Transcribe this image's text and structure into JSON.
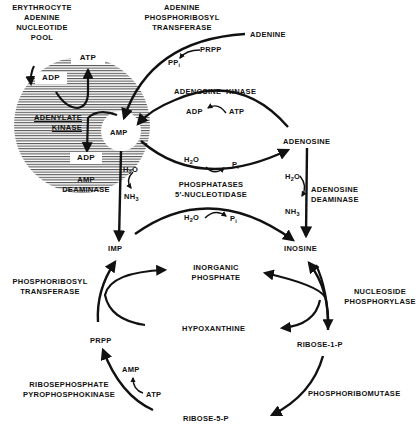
{
  "pool": {
    "label_lines": [
      "ERYTHROCYTE",
      "ADENINE",
      "NUCLEOTIDE",
      "POOL"
    ],
    "atp_box": "ATP",
    "adp_box_top": "ADP",
    "adp_box_bottom": "ADP",
    "enzyme_lines": [
      "ADENYLATE",
      "KINASE"
    ],
    "amp": "AMP"
  },
  "enzymes": {
    "adenine_prt": [
      "ADENINE",
      "PHOSPHORIBOSYL",
      "TRANSFERASE"
    ],
    "adenosine_kinase": "ADENOSINE  KINASE",
    "amp_deaminase": [
      "AMP",
      "DEAMINASE"
    ],
    "phosphatases": [
      "PHOSPHATASES",
      "5′-NUCLEOTIDASE"
    ],
    "adenosine_deaminase": [
      "ADENOSINE",
      "DEAMINASE"
    ],
    "phosphoribosyl_transferase": [
      "PHOSPHORIBOSYL",
      "TRANSFERASE"
    ],
    "nucleoside_phosphorylase": [
      "NUCLEOSIDE",
      "PHOSPHORYLASE"
    ],
    "ribosephosphate_pyrophosphokinase": [
      "RIBOSEPHOSPHATE",
      "PYROPHOSPHOKINASE"
    ],
    "phosphoribomutase": "PHOSPHORIBOMUTASE"
  },
  "metabolites": {
    "adenine": "ADENINE",
    "prpp_top": "PRPP",
    "ppi": "PP",
    "ppi_sub": "i",
    "adk_adp": "ADP",
    "adk_atp": "ATP",
    "adenosine": "ADENOSINE",
    "h2o_phos_top": "H",
    "pi_phos_top": "P",
    "h2o_amp": "H",
    "nh3_amp": "NH",
    "h2o_ado": "H",
    "nh3_ado": "NH",
    "h2o_phos_bottom": "H",
    "pi_phos_bottom": "P",
    "imp": "IMP",
    "inosine": "INOSINE",
    "inorganic_phosphate": [
      "INORGANIC",
      "PHOSPHATE"
    ],
    "hypoxanthine": "HYPOXANTHINE",
    "prpp": "PRPP",
    "ribose_1_p": "RIBOSE-1-P",
    "ribose_5_p": "RIBOSE-5-P",
    "rpk_amp": "AMP",
    "rpk_atp": "ATP",
    "sub_2": "2",
    "sub_3": "3",
    "o": "O",
    "sub_i": "i"
  }
}
